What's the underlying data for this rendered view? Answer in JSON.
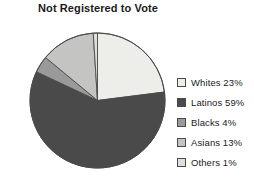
{
  "chart_data": {
    "type": "pie",
    "title": "Not Registered to Vote",
    "subtitle": "",
    "xlabel": "",
    "ylabel": "",
    "legend_position": "right",
    "grid": false,
    "units": "percent",
    "start_angle_deg": 0,
    "direction": "clockwise",
    "categories": [
      "Whites",
      "Latinos",
      "Blacks",
      "Asians",
      "Others"
    ],
    "values": [
      23,
      59,
      4,
      13,
      1
    ],
    "labels": [
      "Whites 23%",
      "Latinos 59%",
      "Blacks 4%",
      "Asians 13%",
      "Others 1%"
    ],
    "colors": [
      "#ededea",
      "#4a4a4a",
      "#9a9a9a",
      "#c4c4c2",
      "#dededa"
    ],
    "slices": [
      {
        "name": "Whites",
        "value": 23,
        "label": "Whites 23%",
        "color": "#ededea"
      },
      {
        "name": "Latinos",
        "value": 59,
        "label": "Latinos 59%",
        "color": "#4a4a4a"
      },
      {
        "name": "Blacks",
        "value": 4,
        "label": "Blacks 4%",
        "color": "#9a9a9a"
      },
      {
        "name": "Asians",
        "value": 13,
        "label": "Asians 13%",
        "color": "#c4c4c2"
      },
      {
        "name": "Others",
        "value": 1,
        "label": "Others 1%",
        "color": "#dededa"
      }
    ]
  },
  "legend": {
    "items": [
      {
        "label": "Whites 23%",
        "swatch": "#ededea"
      },
      {
        "label": "Latinos 59%",
        "swatch": "#4a4a4a"
      },
      {
        "label": "Blacks 4%",
        "swatch": "#9a9a9a"
      },
      {
        "label": "Asians 13%",
        "swatch": "#c4c4c2"
      },
      {
        "label": "Others 1%",
        "swatch": "#dededa"
      }
    ]
  },
  "style": {
    "background": "#ffffff",
    "outline": "#4a4a4a",
    "text": "#1b1b1b"
  }
}
